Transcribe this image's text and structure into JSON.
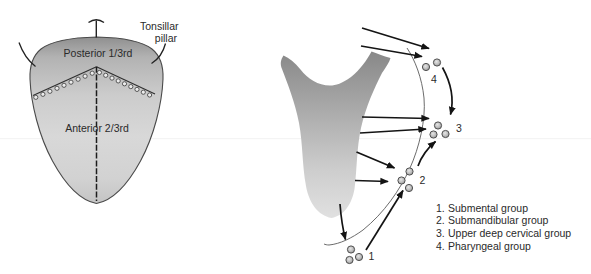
{
  "left_panel": {
    "tonsillar_pillar_label": {
      "line1": "Tonsillar",
      "line2": "pillar"
    },
    "posterior_label": "Posterior 1/3rd",
    "anterior_label": "Anterior 2/3rd"
  },
  "right_panel": {
    "group_markers": {
      "pharyngeal": "4",
      "upper_deep_cervical": "3",
      "submandibular": "2",
      "submental": "1"
    },
    "legend": [
      {
        "number": "1.",
        "label": "Submental group"
      },
      {
        "number": "2.",
        "label": "Submandibular group"
      },
      {
        "number": "3.",
        "label": "Upper deep cervical group"
      },
      {
        "number": "4.",
        "label": "Pharyngeal group"
      }
    ]
  },
  "colors": {
    "background": "#ffffff",
    "line": "#1a1a1a",
    "tongue_gray_dark": "#8c8c8c",
    "tongue_gray_light": "#d8d8d8",
    "node_gray": "#b5b5b5",
    "text": "#2a2a2a"
  }
}
